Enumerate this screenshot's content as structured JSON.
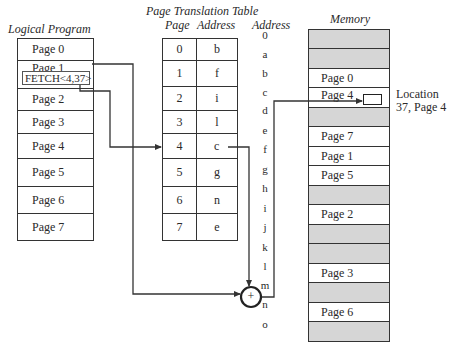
{
  "logical_program": {
    "title": "Logical Program",
    "pages": [
      "Page 0",
      "Page 1",
      "Page 2",
      "Page 3",
      "Page 4",
      "Page 5",
      "Page 6",
      "Page 7"
    ],
    "fetch_instruction": "FETCH<4,37>"
  },
  "page_table": {
    "title": "Page Translation Table",
    "col_page": "Page",
    "col_address": "Address",
    "rows": [
      {
        "page": "0",
        "address": "b"
      },
      {
        "page": "1",
        "address": "f"
      },
      {
        "page": "2",
        "address": "i"
      },
      {
        "page": "3",
        "address": "l"
      },
      {
        "page": "4",
        "address": "c"
      },
      {
        "page": "5",
        "address": "g"
      },
      {
        "page": "6",
        "address": "n"
      },
      {
        "page": "7",
        "address": "e"
      }
    ]
  },
  "memory": {
    "address_title": "Address",
    "title": "Memory",
    "slots": [
      {
        "address": "0",
        "content": ""
      },
      {
        "address": "a",
        "content": ""
      },
      {
        "address": "b",
        "content": "Page 0"
      },
      {
        "address": "c",
        "content": "Page 4"
      },
      {
        "address": "d",
        "content": ""
      },
      {
        "address": "e",
        "content": "Page 7"
      },
      {
        "address": "f",
        "content": "Page 1"
      },
      {
        "address": "g",
        "content": "Page 5"
      },
      {
        "address": "h",
        "content": ""
      },
      {
        "address": "i",
        "content": "Page 2"
      },
      {
        "address": "j",
        "content": ""
      },
      {
        "address": "k",
        "content": ""
      },
      {
        "address": "l",
        "content": "Page 3"
      },
      {
        "address": "m",
        "content": ""
      },
      {
        "address": "n",
        "content": "Page 6"
      },
      {
        "address": "o",
        "content": ""
      }
    ],
    "location_label_line1": "Location",
    "location_label_line2": "37, Page 4"
  },
  "adder_symbol": "+",
  "colors": {
    "line": "#333333",
    "empty_slot": "#d6d6d6",
    "occupied_slot": "#ffffff"
  }
}
